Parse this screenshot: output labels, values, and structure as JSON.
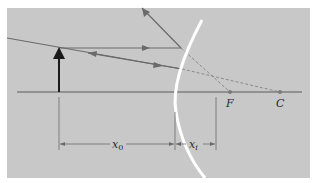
{
  "diagram": {
    "background": "#c8c8c8",
    "line_color": "#6a6a6a",
    "mirror_color": "#ffffff",
    "labels": {
      "focal_point": "F",
      "center_of_curvature": "C",
      "object_distance": "x",
      "object_distance_sub": "0",
      "image_distance": "x",
      "image_distance_sub": "i"
    }
  }
}
